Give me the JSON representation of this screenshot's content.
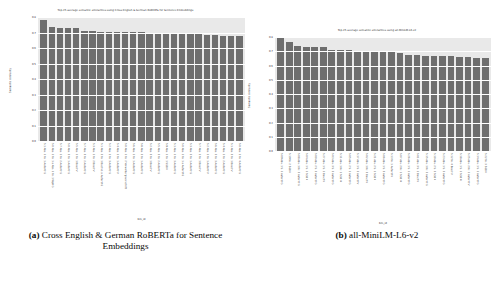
{
  "figure": {
    "subfigures": [
      {
        "tag": "(a)",
        "caption": "Cross English & German RoBERTa for Sentence Embeddings"
      },
      {
        "tag": "(b)",
        "caption": "all-MiniLM-L6-v2"
      }
    ]
  },
  "chart_data": [
    {
      "type": "bar",
      "title": "Top-25 average semantic similarities using Cross English & German RoBERTa for Sentence Embeddings",
      "xlabel": "bm_id",
      "ylabel": "Semantic similarity",
      "ylim": [
        0.0,
        0.8
      ],
      "yticks": [
        "0.0",
        "0.1",
        "0.2",
        "0.3",
        "0.4",
        "0.5",
        "0.6",
        "0.7",
        "0.8"
      ],
      "grid": true,
      "legend": "none",
      "bar_color": "#6e6e6e",
      "axes_background": "#e9e9e9",
      "categories": [
        "5.1 Abs. 1 Nr. 1 AufenthG",
        "5.0 Abs. 1 Nr. 1 a Abs. 1 Nr. 1 WpHG",
        "5.7 Abs. 1 Nr. 2 AufenthG",
        "5.0 Abs. 2 Nr. 1 AufenthG",
        "5.5 Abs. 1 Nr. 1 BeschV",
        "5.7 Abs. 3 Nr. 2 AufenthG",
        "5.3 Abs. 1 Nr. 2 BeschV",
        "5.1 Abs. 2 Nr. 1 Buchst. a AufenthG",
        "5.2 Abs. 1 Nr. 3 AufenthG",
        "5.4 Abs. 1 Nr. 1 AufenthV",
        "5.0 Abs. 1 Nr. 2 Verwaltungsvorschrift",
        "5.6 Abs. 1 Nr. 1 AufenthG",
        "5.8 Abs. 2 Nr. 1 AufenthG",
        "5.2 Abs. 3 Nr. 1 BeschV",
        "5.5 Abs. 2 Nr. 2 AufenthG",
        "5.9 Abs. 1 Nr. 1 SGB II",
        "5.1 Abs. 1 Nr. 3 AufenthG",
        "5.0 Abs. 1 Nr. 1 a AufenthG",
        "5.3 Abs. 2 Nr. 1 AufenthG",
        "5.7 Abs. 1 Nr. 1 BeschV",
        "5.2 Abs. 1 Nr. 1 AufenthV",
        "5.6 Abs. 2 Nr. 3 AufenthG",
        "5.4 Abs. 1 Nr. 2 AufenthG",
        "5.1 Abs. 3 Nr. 1 BeschV",
        "5.0 Abs. 1 Nr. 4 AufenthG"
      ],
      "values": [
        0.782,
        0.733,
        0.729,
        0.727,
        0.726,
        0.713,
        0.711,
        0.706,
        0.705,
        0.704,
        0.703,
        0.702,
        0.701,
        0.7,
        0.699,
        0.698,
        0.696,
        0.694,
        0.693,
        0.69,
        0.682,
        0.681,
        0.68,
        0.679,
        0.678
      ]
    },
    {
      "type": "bar",
      "title": "Top-25 average semantic similarities using all-MiniLM-L6-v2",
      "xlabel": "bm_id",
      "ylabel": "Semantic similarity",
      "ylim": [
        0.0,
        0.8
      ],
      "yticks": [
        "0.0",
        "0.1",
        "0.2",
        "0.3",
        "0.4",
        "0.5",
        "0.6",
        "0.7",
        "0.8"
      ],
      "grid": true,
      "legend": "none",
      "bar_color": "#6e6e6e",
      "axes_background": "#e9e9e9",
      "categories": [
        "5.09 Abs. 1 S. 1 AufenthG",
        "5.19 Nr. 2 SGB II",
        "5.08 Abs. 1 Nr. 2 AufenthG",
        "5.04 Abs. 1 S. 1 SGB II",
        "5.00 Abs. 2 S. 2 AufenthG",
        "5.27 Abs. 1 S. 1 BeschV",
        "5.03 Abs. 3 S. 2 AufenthG",
        "5.11 Abs. 1 Nr. 1 SGB III",
        "5.05 Abs. 2 S. 1 AufenthG",
        "5.17 Abs. 1 S. 2 AufenthV",
        "5.02 Abs. 1 Nr. 3 BeschV",
        "5.21 Abs. 2 S. 1 SGB II",
        "5.06 Abs. 1 S. 3 AufenthG",
        "5.13 Nr. 1 AufenthV",
        "5.07 Abs. 2 Nr. 1 SGB III",
        "5.26 Abs. 1 S. 1 AufenthG",
        "5.01 Abs. 3 S. 1 BeschV",
        "5.15 Abs. 1 Nr. 2 AufenthG",
        "5.10 Abs. 2 S. 2 SGB II",
        "5.23 Abs. 1 S. 2 AufenthG",
        "5.12 Nr. 4 BeschV",
        "5.18 Abs. 1 S. 1 SGB III",
        "5.25 Abs. 2 Nr. 1 AufenthV",
        "5.14 Abs. 1 S. 1 AufenthG",
        "5.22 Nr. 3 SGB II"
      ],
      "values": [
        0.8,
        0.768,
        0.735,
        0.733,
        0.732,
        0.73,
        0.712,
        0.708,
        0.706,
        0.704,
        0.7,
        0.698,
        0.693,
        0.692,
        0.69,
        0.673,
        0.671,
        0.67,
        0.669,
        0.667,
        0.665,
        0.663,
        0.66,
        0.652,
        0.65
      ]
    }
  ]
}
